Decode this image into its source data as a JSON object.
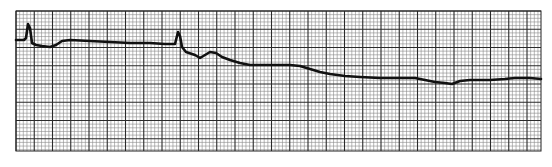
{
  "chart_data": {
    "type": "line",
    "title": "",
    "subtitle": "",
    "xlabel": "",
    "ylabel": "",
    "grid": true,
    "legend": "none",
    "x_units": "pixels",
    "y_units": "pixels (screen y, down is positive)",
    "xlim": [
      16,
      541
    ],
    "ylim": [
      11,
      151
    ],
    "series": [
      {
        "name": "ECG trace",
        "color": "#111111",
        "points": [
          [
            16,
            40
          ],
          [
            24,
            40
          ],
          [
            26,
            38
          ],
          [
            28,
            24
          ],
          [
            30,
            28
          ],
          [
            32,
            43
          ],
          [
            36,
            45
          ],
          [
            42,
            46
          ],
          [
            50,
            47
          ],
          [
            56,
            45
          ],
          [
            62,
            41
          ],
          [
            70,
            40
          ],
          [
            90,
            41
          ],
          [
            110,
            42
          ],
          [
            130,
            43
          ],
          [
            150,
            43
          ],
          [
            165,
            44
          ],
          [
            175,
            44
          ],
          [
            176,
            40
          ],
          [
            178,
            32
          ],
          [
            180,
            36
          ],
          [
            182,
            47
          ],
          [
            186,
            52
          ],
          [
            195,
            55
          ],
          [
            200,
            58
          ],
          [
            205,
            55
          ],
          [
            210,
            52
          ],
          [
            216,
            53
          ],
          [
            222,
            57
          ],
          [
            230,
            60
          ],
          [
            240,
            63
          ],
          [
            250,
            65
          ],
          [
            270,
            65
          ],
          [
            290,
            65
          ],
          [
            300,
            66
          ],
          [
            310,
            69
          ],
          [
            320,
            72
          ],
          [
            330,
            74
          ],
          [
            345,
            76
          ],
          [
            360,
            77
          ],
          [
            380,
            78
          ],
          [
            400,
            78
          ],
          [
            415,
            78
          ],
          [
            425,
            80
          ],
          [
            435,
            82
          ],
          [
            445,
            83
          ],
          [
            452,
            84
          ],
          [
            460,
            81
          ],
          [
            470,
            80
          ],
          [
            490,
            80
          ],
          [
            505,
            79
          ],
          [
            515,
            78
          ],
          [
            530,
            78
          ],
          [
            541,
            79
          ]
        ]
      }
    ],
    "paper": {
      "background": "#ffffff",
      "minor_grid_color": "#8a8a8a",
      "major_grid_color": "#2a2a2a",
      "minor_spacing_px": 3.65,
      "major_every_minor": 5
    }
  }
}
